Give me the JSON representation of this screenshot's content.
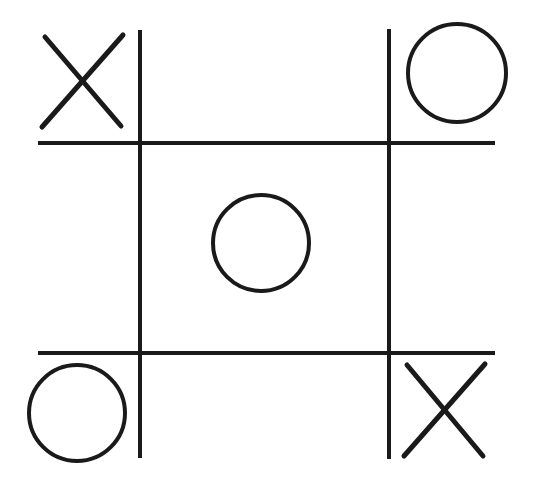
{
  "game": {
    "type": "tic-tac-toe",
    "title": "",
    "board": [
      [
        "X",
        "",
        "O"
      ],
      [
        "",
        "O",
        ""
      ],
      [
        "O",
        "",
        "X"
      ]
    ],
    "cells": [
      {
        "row": 0,
        "col": 0,
        "mark": "X"
      },
      {
        "row": 0,
        "col": 1,
        "mark": ""
      },
      {
        "row": 0,
        "col": 2,
        "mark": "O"
      },
      {
        "row": 1,
        "col": 0,
        "mark": ""
      },
      {
        "row": 1,
        "col": 1,
        "mark": "O"
      },
      {
        "row": 1,
        "col": 2,
        "mark": ""
      },
      {
        "row": 2,
        "col": 0,
        "mark": "O"
      },
      {
        "row": 2,
        "col": 1,
        "mark": ""
      },
      {
        "row": 2,
        "col": 2,
        "mark": "X"
      }
    ],
    "colors": {
      "background": "#ffffff",
      "ink": "#1a1a1a"
    }
  }
}
